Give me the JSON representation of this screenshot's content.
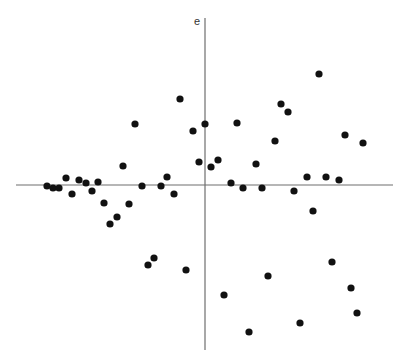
{
  "chart_data": {
    "type": "scatter",
    "title": "",
    "xlabel": "",
    "ylabel": "e",
    "grid": false,
    "legend": null,
    "axes_pixel": {
      "origin": [
        205,
        185
      ],
      "x_axis": [
        16,
        393
      ],
      "y_axis": [
        18,
        350
      ]
    },
    "points": [
      [
        47,
        186
      ],
      [
        53,
        188
      ],
      [
        59,
        188
      ],
      [
        66,
        178
      ],
      [
        72,
        194
      ],
      [
        79,
        180
      ],
      [
        86,
        183
      ],
      [
        92,
        191
      ],
      [
        98,
        182
      ],
      [
        104,
        203
      ],
      [
        110,
        224
      ],
      [
        117,
        217
      ],
      [
        123,
        166
      ],
      [
        129,
        204
      ],
      [
        135,
        124
      ],
      [
        142,
        186
      ],
      [
        148,
        265
      ],
      [
        154,
        258
      ],
      [
        161,
        186
      ],
      [
        167,
        177
      ],
      [
        174,
        194
      ],
      [
        180,
        99
      ],
      [
        186,
        270
      ],
      [
        193,
        131
      ],
      [
        199,
        162
      ],
      [
        205,
        124
      ],
      [
        211,
        167
      ],
      [
        218,
        160
      ],
      [
        224,
        295
      ],
      [
        231,
        183
      ],
      [
        237,
        123
      ],
      [
        243,
        188
      ],
      [
        249,
        332
      ],
      [
        256,
        164
      ],
      [
        262,
        188
      ],
      [
        268,
        276
      ],
      [
        275,
        141
      ],
      [
        281,
        104
      ],
      [
        288,
        112
      ],
      [
        294,
        191
      ],
      [
        300,
        323
      ],
      [
        307,
        177
      ],
      [
        313,
        211
      ],
      [
        319,
        74
      ],
      [
        326,
        177
      ],
      [
        332,
        262
      ],
      [
        339,
        180
      ],
      [
        345,
        135
      ],
      [
        351,
        288
      ],
      [
        357,
        313
      ],
      [
        363,
        143
      ]
    ]
  },
  "axis": {
    "y_label": "e"
  }
}
